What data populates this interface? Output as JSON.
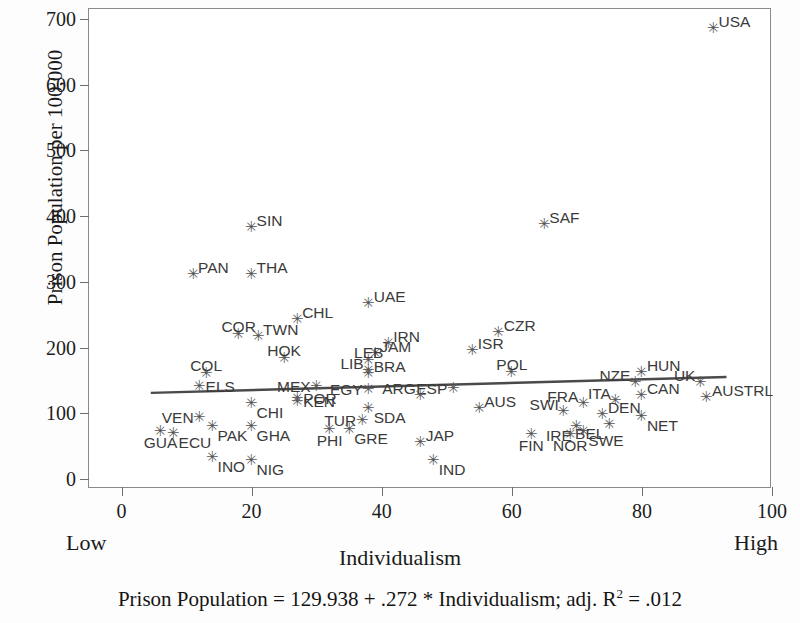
{
  "chart_data": {
    "type": "scatter",
    "title": "",
    "xlabel": "Individualism",
    "ylabel": "Prison Population per 100,000",
    "xlim": [
      -5,
      100
    ],
    "ylim": [
      -15,
      715
    ],
    "xticks": [
      0,
      20,
      40,
      60,
      80,
      100
    ],
    "yticks": [
      0,
      100,
      200,
      300,
      400,
      500,
      600,
      700
    ],
    "grid": false,
    "legend": null,
    "axis_endpoint_labels": {
      "low": "Low",
      "high": "High"
    },
    "equation": "Prison Population = 129.938 + .272 * Individualism; adj. R",
    "equation_exponent": "2",
    "equation_tail": " = .012",
    "regression": {
      "intercept": 129.938,
      "slope": 0.272,
      "adj_r_squared": 0.012,
      "x_start": 4.5,
      "x_end": 93.0,
      "color": "#4a4a4a"
    },
    "marker": {
      "glyph": "✳",
      "color": "#555555"
    },
    "points": [
      {
        "label": "USA",
        "x": 91,
        "y": 688,
        "lp": "ne"
      },
      {
        "label": "SAF",
        "x": 65,
        "y": 390,
        "lp": "ne"
      },
      {
        "label": "SIN",
        "x": 20,
        "y": 385,
        "lp": "ne"
      },
      {
        "label": "PAN",
        "x": 11,
        "y": 313,
        "lp": "ne"
      },
      {
        "label": "THA",
        "x": 20,
        "y": 313,
        "lp": "ne"
      },
      {
        "label": "UAE",
        "x": 38,
        "y": 269,
        "lp": "ne"
      },
      {
        "label": "CHL",
        "x": 27,
        "y": 245,
        "lp": "ne"
      },
      {
        "label": "COR",
        "x": 18,
        "y": 222,
        "lp": "n"
      },
      {
        "label": "TWN",
        "x": 21,
        "y": 219,
        "lp": "ne"
      },
      {
        "label": "CZR",
        "x": 58,
        "y": 226,
        "lp": "ne"
      },
      {
        "label": "IRN",
        "x": 41,
        "y": 209,
        "lp": "ne"
      },
      {
        "label": "ISR",
        "x": 54,
        "y": 198,
        "lp": "ne"
      },
      {
        "label": "JAM",
        "x": 39,
        "y": 193,
        "lp": "ne"
      },
      {
        "label": "HOK",
        "x": 25,
        "y": 185,
        "lp": "n"
      },
      {
        "label": "LEB",
        "x": 38,
        "y": 183,
        "lp": "n"
      },
      {
        "label": "LIB",
        "x": 38,
        "y": 168,
        "lp": "nw"
      },
      {
        "label": "BRA",
        "x": 38,
        "y": 163,
        "lp": "ne"
      },
      {
        "label": "HUN",
        "x": 80,
        "y": 165,
        "lp": "ne"
      },
      {
        "label": "POL",
        "x": 60,
        "y": 165,
        "lp": "n"
      },
      {
        "label": "COL",
        "x": 13,
        "y": 163,
        "lp": "n"
      },
      {
        "label": "NZE",
        "x": 79,
        "y": 150,
        "lp": "nw"
      },
      {
        "label": "UK",
        "x": 89,
        "y": 150,
        "lp": "nw"
      },
      {
        "label": "ELS",
        "x": 12,
        "y": 143,
        "lp": "e"
      },
      {
        "label": "MEX",
        "x": 30,
        "y": 143,
        "lp": "w"
      },
      {
        "label": "EGY",
        "x": 38,
        "y": 139,
        "lp": "w"
      },
      {
        "label": "ESP",
        "x": 51,
        "y": 140,
        "lp": "w"
      },
      {
        "label": "ARG",
        "x": 46,
        "y": 130,
        "lp": "nw"
      },
      {
        "label": "CAN",
        "x": 80,
        "y": 130,
        "lp": "ne"
      },
      {
        "label": "AUSTRL",
        "x": 90,
        "y": 127,
        "lp": "ne"
      },
      {
        "label": "POR",
        "x": 27,
        "y": 125,
        "lp": "e"
      },
      {
        "label": "KEN",
        "x": 27,
        "y": 120,
        "lp": "e"
      },
      {
        "label": "ITA",
        "x": 76,
        "y": 122,
        "lp": "nw"
      },
      {
        "label": "FRA",
        "x": 71,
        "y": 117,
        "lp": "nw"
      },
      {
        "label": "CHI",
        "x": 20,
        "y": 118,
        "lp": "se"
      },
      {
        "label": "SDA",
        "x": 38,
        "y": 110,
        "lp": "se"
      },
      {
        "label": "AUS",
        "x": 55,
        "y": 110,
        "lp": "ne"
      },
      {
        "label": "SWI",
        "x": 68,
        "y": 105,
        "lp": "nw"
      },
      {
        "label": "DEN",
        "x": 74,
        "y": 100,
        "lp": "ne"
      },
      {
        "label": "NET",
        "x": 80,
        "y": 98,
        "lp": "se"
      },
      {
        "label": "TUR",
        "x": 37,
        "y": 92,
        "lp": "w"
      },
      {
        "label": "VEN",
        "x": 12,
        "y": 96,
        "lp": "w"
      },
      {
        "label": "PAK",
        "x": 14,
        "y": 82,
        "lp": "se"
      },
      {
        "label": "GHA",
        "x": 20,
        "y": 82,
        "lp": "se"
      },
      {
        "label": "PHI",
        "x": 32,
        "y": 78,
        "lp": "s"
      },
      {
        "label": "GRE",
        "x": 35,
        "y": 78,
        "lp": "se"
      },
      {
        "label": "BEL",
        "x": 75,
        "y": 85,
        "lp": "sw"
      },
      {
        "label": "IRE",
        "x": 70,
        "y": 82,
        "lp": "sw"
      },
      {
        "label": "SWE",
        "x": 71,
        "y": 75,
        "lp": "se"
      },
      {
        "label": "NOR",
        "x": 69,
        "y": 70,
        "lp": "s"
      },
      {
        "label": "GUA",
        "x": 6,
        "y": 75,
        "lp": "s"
      },
      {
        "label": "ECU",
        "x": 8,
        "y": 72,
        "lp": "se"
      },
      {
        "label": "FIN",
        "x": 63,
        "y": 70,
        "lp": "s"
      },
      {
        "label": "JAP",
        "x": 46,
        "y": 58,
        "lp": "ne"
      },
      {
        "label": "INO",
        "x": 14,
        "y": 35,
        "lp": "se"
      },
      {
        "label": "NIG",
        "x": 20,
        "y": 30,
        "lp": "se"
      },
      {
        "label": "IND",
        "x": 48,
        "y": 30,
        "lp": "se"
      }
    ]
  }
}
